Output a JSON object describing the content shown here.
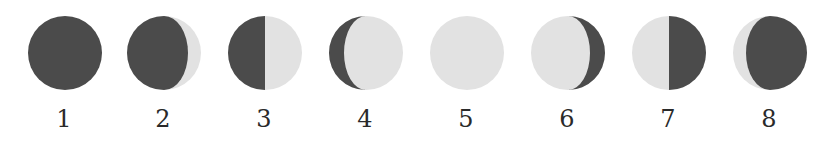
{
  "diagram": {
    "colors": {
      "dark": "#4b4b4b",
      "light": "#e2e2e2"
    },
    "phases": [
      {
        "label": "1",
        "center_x": 64,
        "shape": "all-dark"
      },
      {
        "label": "2",
        "center_x": 163,
        "shape": "dark-gibbous-left-light-crescent-right"
      },
      {
        "label": "3",
        "center_x": 264,
        "shape": "dark-left-half-light-right-half"
      },
      {
        "label": "4",
        "center_x": 365,
        "shape": "dark-crescent-left-light-gibbous"
      },
      {
        "label": "5",
        "center_x": 466,
        "shape": "all-light"
      },
      {
        "label": "6",
        "center_x": 567,
        "shape": "light-gibbous-dark-crescent-right"
      },
      {
        "label": "7",
        "center_x": 668,
        "shape": "light-left-half-dark-right-half"
      },
      {
        "label": "8",
        "center_x": 769,
        "shape": "light-crescent-left-dark-gibbous-right"
      }
    ]
  }
}
